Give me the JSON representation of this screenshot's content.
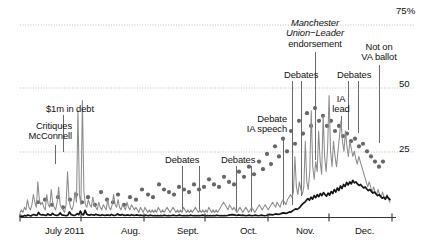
{
  "chart_data": {
    "type": "line",
    "title": "",
    "xlabel": "",
    "ylabel": "",
    "ylim": [
      0,
      80
    ],
    "yticks": [
      25,
      50,
      75
    ],
    "ytick_labels": [
      "25",
      "50",
      "75%"
    ],
    "grid": true,
    "legend_position": "none",
    "x": "2011-06-22 to 2011-12-31 (daily)",
    "xtick_labels": [
      "July 2011",
      "Aug.",
      "Sept.",
      "Oct.",
      "Nov.",
      "Dec."
    ],
    "series": [
      {
        "name": "gray-line",
        "color": "#888888",
        "style": "solid-thin",
        "values": [
          2,
          3,
          2,
          4,
          3,
          7,
          4,
          3,
          5,
          9,
          6,
          4,
          14,
          7,
          5,
          6,
          4,
          3,
          9,
          5,
          4,
          11,
          6,
          4,
          3,
          6,
          12,
          5,
          4,
          3,
          2,
          5,
          18,
          7,
          4,
          3,
          5,
          10,
          6,
          42,
          9,
          5,
          46,
          10,
          5,
          4,
          7,
          5,
          4,
          8,
          5,
          4,
          3,
          6,
          4,
          3,
          5,
          4,
          3,
          7,
          4,
          3,
          5,
          9,
          5,
          4,
          7,
          4,
          3,
          5,
          4,
          3,
          6,
          4,
          3,
          5,
          4,
          3,
          4,
          3,
          2,
          4,
          3,
          2,
          4,
          3,
          2,
          3,
          2,
          3,
          2,
          3,
          2,
          4,
          3,
          2,
          3,
          2,
          3,
          4,
          3,
          2,
          3,
          4,
          3,
          2,
          3,
          2,
          3,
          2,
          4,
          3,
          2,
          3,
          2,
          3,
          2,
          3,
          4,
          3,
          2,
          3,
          2,
          3,
          2,
          3,
          2,
          4,
          3,
          2,
          3,
          2,
          3,
          2,
          3,
          4,
          5,
          6,
          5,
          4,
          3,
          5,
          4,
          3,
          4,
          3,
          2,
          3,
          4,
          3,
          2,
          3,
          4,
          3,
          2,
          3,
          4,
          3,
          2,
          3,
          4,
          5,
          4,
          3,
          4,
          5,
          4,
          3,
          4,
          5,
          6,
          5,
          4,
          6,
          5,
          4,
          6,
          7,
          6,
          5,
          7,
          8,
          9,
          8,
          10,
          24,
          12,
          9,
          14,
          11,
          9,
          12,
          30,
          14,
          11,
          18,
          42,
          20,
          15,
          22,
          18,
          34,
          22,
          17,
          40,
          24,
          18,
          27,
          48,
          26,
          20,
          30,
          24,
          20,
          26,
          32,
          38,
          30,
          26,
          34,
          28,
          24,
          30,
          27,
          24,
          26,
          23,
          21,
          24,
          22,
          20,
          18,
          16,
          14,
          12,
          14,
          12,
          10,
          12,
          10,
          9,
          11,
          9,
          8,
          10,
          8,
          7,
          9,
          7,
          6
        ]
      },
      {
        "name": "black-line",
        "color": "#111111",
        "style": "solid-thick",
        "values": [
          0.5,
          0.6,
          0.5,
          0.8,
          0.6,
          1,
          0.8,
          0.6,
          1,
          1.2,
          0.9,
          0.8,
          2,
          1.2,
          1,
          1.1,
          0.9,
          0.8,
          1.4,
          1,
          0.9,
          1.6,
          1.1,
          0.9,
          0.8,
          1.1,
          1.8,
          1,
          0.9,
          0.8,
          0.7,
          1,
          2.2,
          1.2,
          0.9,
          0.8,
          1,
          1.5,
          1.1,
          2.5,
          1.3,
          1,
          2.8,
          1.4,
          1,
          0.9,
          1.2,
          1,
          0.9,
          1.3,
          1,
          0.9,
          0.8,
          1.1,
          0.9,
          0.8,
          1,
          0.9,
          0.8,
          1.2,
          0.9,
          0.8,
          1,
          1.4,
          1,
          0.9,
          1.2,
          0.9,
          0.8,
          1,
          0.9,
          0.8,
          1.1,
          0.9,
          0.8,
          1,
          0.9,
          0.8,
          0.9,
          0.8,
          0.7,
          0.9,
          0.8,
          0.7,
          0.9,
          0.8,
          0.7,
          0.8,
          0.7,
          0.8,
          0.7,
          0.8,
          0.7,
          0.9,
          0.8,
          0.7,
          0.8,
          0.7,
          0.8,
          0.9,
          0.8,
          0.7,
          0.8,
          0.9,
          0.8,
          0.7,
          0.8,
          0.7,
          0.8,
          0.7,
          0.9,
          0.8,
          0.7,
          0.8,
          0.7,
          0.8,
          0.7,
          0.8,
          0.9,
          0.8,
          0.7,
          0.8,
          0.7,
          0.8,
          0.7,
          0.8,
          0.7,
          0.9,
          0.8,
          0.7,
          0.8,
          0.7,
          0.8,
          0.7,
          0.8,
          0.9,
          1,
          1.1,
          1,
          0.9,
          0.8,
          1,
          0.9,
          0.8,
          0.9,
          0.8,
          0.7,
          0.8,
          0.9,
          0.8,
          0.7,
          0.8,
          0.9,
          0.8,
          0.7,
          0.8,
          0.9,
          0.8,
          0.7,
          0.8,
          1,
          1.2,
          1.1,
          1,
          1.2,
          1.4,
          1.3,
          1.2,
          1.4,
          1.6,
          1.8,
          1.7,
          1.6,
          1.9,
          2.2,
          2.1,
          2.6,
          3,
          3.4,
          3.2,
          3.6,
          4.2,
          5,
          5.6,
          6,
          6.8,
          7.4,
          6.8,
          8,
          7.2,
          8.6,
          7.8,
          9,
          8.2,
          9.4,
          8.6,
          9.8,
          9,
          8.4,
          9.6,
          8.8,
          10.2,
          9.4,
          11,
          10,
          11.6,
          10.6,
          12.4,
          11.4,
          13,
          12.2,
          13.8,
          12.8,
          14,
          13.2,
          14.6,
          13.6,
          14,
          13.2,
          12.6,
          13,
          12.2,
          11.6,
          12,
          11.2,
          10.6,
          11,
          10.2,
          9.6,
          10,
          9.2,
          8.6,
          9,
          8.2,
          7.6,
          8,
          7.2,
          8.4,
          7.6,
          7
        ]
      }
    ],
    "scatter": {
      "name": "poll-dots",
      "color": "#666666",
      "points": [
        [
          38,
          6
        ],
        [
          45,
          7
        ],
        [
          52,
          5
        ],
        [
          58,
          8
        ],
        [
          63,
          4
        ],
        [
          70,
          7
        ],
        [
          76,
          9
        ],
        [
          82,
          6
        ],
        [
          88,
          8
        ],
        [
          95,
          5
        ],
        [
          101,
          10
        ],
        [
          107,
          7
        ],
        [
          113,
          6
        ],
        [
          118,
          9
        ],
        [
          124,
          5
        ],
        [
          130,
          8
        ],
        [
          136,
          7
        ],
        [
          142,
          11
        ],
        [
          148,
          9
        ],
        [
          153,
          8
        ],
        [
          159,
          13
        ],
        [
          164,
          11
        ],
        [
          169,
          10
        ],
        [
          174,
          9
        ],
        [
          179,
          12
        ],
        [
          184,
          11
        ],
        [
          189,
          10
        ],
        [
          194,
          13
        ],
        [
          199,
          11
        ],
        [
          204,
          12
        ],
        [
          209,
          15
        ],
        [
          214,
          13
        ],
        [
          219,
          12
        ],
        [
          224,
          16
        ],
        [
          229,
          14
        ],
        [
          234,
          13
        ],
        [
          239,
          18
        ],
        [
          244,
          16
        ],
        [
          249,
          20
        ],
        [
          254,
          17
        ],
        [
          259,
          22
        ],
        [
          263,
          19
        ],
        [
          267,
          25
        ],
        [
          271,
          21
        ],
        [
          275,
          28
        ],
        [
          279,
          24
        ],
        [
          283,
          31
        ],
        [
          287,
          26
        ],
        [
          291,
          34
        ],
        [
          295,
          29
        ],
        [
          299,
          38
        ],
        [
          303,
          33
        ],
        [
          307,
          41
        ],
        [
          311,
          36
        ],
        [
          315,
          43
        ],
        [
          319,
          38
        ],
        [
          323,
          40
        ],
        [
          327,
          36
        ],
        [
          331,
          38
        ],
        [
          335,
          34
        ],
        [
          339,
          36
        ],
        [
          343,
          32
        ],
        [
          347,
          33
        ],
        [
          351,
          30
        ],
        [
          355,
          31
        ],
        [
          359,
          28
        ],
        [
          363,
          29
        ],
        [
          367,
          26
        ],
        [
          371,
          24
        ],
        [
          375,
          22
        ],
        [
          379,
          20
        ],
        [
          383,
          22
        ]
      ]
    },
    "annotations": [
      {
        "id": "critiques-mcconnell",
        "text": "Critiques\nMcConnell",
        "align": "right",
        "x": 13,
        "y": 121,
        "leader_x": 55,
        "leader_y1": 145,
        "leader_y2": 164
      },
      {
        "id": "1m-in-debt",
        "text": "$1m in debt",
        "align": "left",
        "x": 46,
        "y": 104,
        "leader_x": 63,
        "leader_y1": 115,
        "leader_y2": 152
      },
      {
        "id": "debates-sept",
        "text": "Debates",
        "align": "left",
        "x": 168,
        "y": 155,
        "leader_x": 182,
        "leader_y1": 166,
        "leader_y2": 212
      },
      {
        "id": "debates-sept-b",
        "text": "",
        "align": "left",
        "x": 0,
        "y": 0,
        "leader_x": 199,
        "leader_y1": 166,
        "leader_y2": 212
      },
      {
        "id": "debates-oct",
        "text": "Debates",
        "align": "left",
        "x": 224,
        "y": 155,
        "leader_x": 236,
        "leader_y1": 166,
        "leader_y2": 212
      },
      {
        "id": "debates-oct-b",
        "text": "",
        "align": "left",
        "x": 0,
        "y": 0,
        "leader_x": 251,
        "leader_y1": 166,
        "leader_y2": 212
      },
      {
        "id": "debate-ia-speech",
        "text": "Debate\nIA speech",
        "align": "right",
        "x": 240,
        "y": 114,
        "leader_x": 283,
        "leader_y1": 139,
        "leader_y2": 205
      },
      {
        "id": "debates-nov",
        "text": "Debates",
        "align": "left",
        "x": 285,
        "y": 70,
        "leader_x": 292,
        "leader_y1": 81,
        "leader_y2": 205
      },
      {
        "id": "debates-nov-b",
        "text": "",
        "align": "left",
        "x": 0,
        "y": 0,
        "leader_x": 301,
        "leader_y1": 81,
        "leader_y2": 196
      },
      {
        "id": "manchester-union-leader",
        "text": "Manchester\nUnion−Leader\nendorsement",
        "align": "center",
        "x": 276,
        "y": 18,
        "leader_x": 315,
        "leader_y1": 52,
        "leader_y2": 160,
        "italic_lines": 2
      },
      {
        "id": "ia-lead",
        "text": "IA\nlead",
        "align": "center",
        "x": 332,
        "y": 94,
        "leader_x": 341,
        "leader_y1": 116,
        "leader_y2": 131
      },
      {
        "id": "debates-dec",
        "text": "Debates",
        "align": "left",
        "x": 339,
        "y": 70,
        "leader_x": 348,
        "leader_y1": 81,
        "leader_y2": 130
      },
      {
        "id": "debates-dec-b",
        "text": "",
        "align": "left",
        "x": 0,
        "y": 0,
        "leader_x": 358,
        "leader_y1": 81,
        "leader_y2": 133
      },
      {
        "id": "not-on-va-ballot",
        "text": "Not on\nVA ballot",
        "align": "center",
        "x": 355,
        "y": 42,
        "leader_x": 379,
        "leader_y1": 65,
        "leader_y2": 143
      }
    ]
  },
  "axis": {
    "y_labels": [
      {
        "id": "y-75",
        "text": "75%",
        "top": 5
      },
      {
        "id": "y-50",
        "text": "50",
        "top": 78
      },
      {
        "id": "y-25",
        "text": "25",
        "top": 143
      }
    ],
    "x_labels": [
      {
        "id": "x-july",
        "text": "July 2011",
        "left": 45
      },
      {
        "id": "x-aug",
        "text": "Aug.",
        "left": 121
      },
      {
        "id": "x-sept",
        "text": "Sept.",
        "left": 177
      },
      {
        "id": "x-oct",
        "text": "Oct.",
        "left": 240
      },
      {
        "id": "x-nov",
        "text": "Nov.",
        "left": 296
      },
      {
        "id": "x-dec",
        "text": "Dec.",
        "left": 355
      }
    ]
  },
  "colors": {
    "gray_line": "#8c8c8c",
    "black_line": "#141414",
    "dot": "#6b6b6b",
    "grid": "#bdbdbd",
    "axis": "#333333",
    "background": "#ffffff"
  }
}
